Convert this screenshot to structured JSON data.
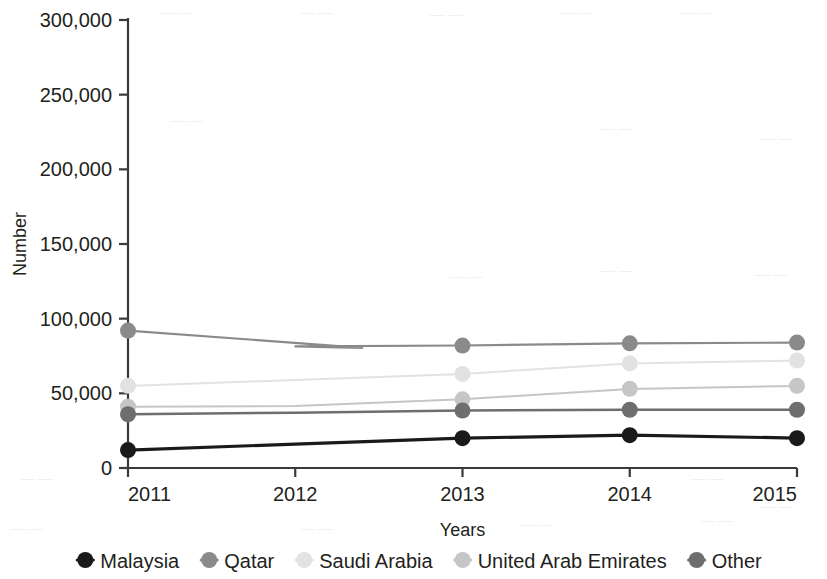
{
  "chart_data": {
    "type": "line",
    "title": "",
    "xlabel": "Years",
    "ylabel": "Number",
    "categories": [
      "2011",
      "2012",
      "2013",
      "2014",
      "2015"
    ],
    "x": [
      2011,
      2012,
      2013,
      2014,
      2015
    ],
    "xlim": [
      2011,
      2015
    ],
    "ylim": [
      0,
      300000
    ],
    "yticks": [
      0,
      50000,
      100000,
      150000,
      200000,
      250000,
      300000
    ],
    "ytick_labels": [
      "0",
      "50,000",
      "100,000",
      "150,000",
      "200,000",
      "250,000",
      "300,000"
    ],
    "xtick_labels": [
      "2011",
      "2012",
      "2013",
      "2014",
      "2015"
    ],
    "grid": false,
    "legend_position": "bottom",
    "markers_at": [
      2011,
      2013,
      2014,
      2015
    ],
    "series": [
      {
        "name": "Malaysia",
        "color": "#1a1a1a",
        "values": [
          12000,
          16000,
          20000,
          22000,
          20000
        ],
        "line_width": 3.2,
        "marker_size": 8
      },
      {
        "name": "Qatar",
        "color": "#8a8a8a",
        "values": [
          92000,
          81500,
          82000,
          83500,
          84000
        ],
        "line_width": 2.2,
        "marker_size": 8
      },
      {
        "name": "Saudi Arabia",
        "color": "#e2e2e2",
        "values": [
          55000,
          59000,
          63000,
          70000,
          72000
        ],
        "line_width": 2.0,
        "marker_size": 8
      },
      {
        "name": "United Arab Emirates",
        "color": "#c6c6c6",
        "values": [
          41000,
          41500,
          46000,
          53000,
          55000
        ],
        "line_width": 2.0,
        "marker_size": 8
      },
      {
        "name": "Other",
        "color": "#6e6e6e",
        "values": [
          36000,
          37000,
          38500,
          39000,
          39000
        ],
        "line_width": 2.4,
        "marker_size": 8
      }
    ]
  },
  "axis": {
    "y_title": "Number",
    "x_title": "Years",
    "axis_color": "#3a3a3a"
  },
  "legend": {
    "entries": [
      {
        "label": "Malaysia",
        "color": "#1a1a1a"
      },
      {
        "label": "Qatar",
        "color": "#8a8a8a"
      },
      {
        "label": "Saudi Arabia",
        "color": "#e2e2e2"
      },
      {
        "label": "United Arab Emirates",
        "color": "#c6c6c6"
      },
      {
        "label": "Other",
        "color": "#6e6e6e"
      }
    ]
  }
}
